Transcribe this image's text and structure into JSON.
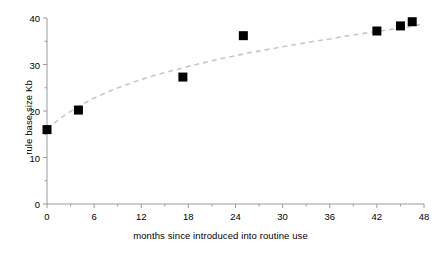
{
  "chart_data": {
    "type": "scatter",
    "title": "",
    "xlabel": "months since introduced into routine use",
    "ylabel": "rule base size Kb",
    "xlim": [
      0,
      48
    ],
    "ylim": [
      0,
      40
    ],
    "xticks": [
      0,
      6,
      12,
      18,
      24,
      30,
      36,
      42,
      48
    ],
    "yticks": [
      0,
      10,
      20,
      30,
      40
    ],
    "x_minor_tick_interval": 3,
    "y_minor_tick_interval": 5,
    "grid": false,
    "legend": null,
    "marker": {
      "shape": "square",
      "color": "#000000",
      "size_px": 9
    },
    "series": [
      {
        "name": "rule base size",
        "points": [
          {
            "x": 0.0,
            "y": 16.0
          },
          {
            "x": 4.0,
            "y": 20.2
          },
          {
            "x": 17.3,
            "y": 27.3
          },
          {
            "x": 25.0,
            "y": 36.2
          },
          {
            "x": 42.0,
            "y": 37.2
          },
          {
            "x": 45.0,
            "y": 38.3
          },
          {
            "x": 46.5,
            "y": 39.2
          }
        ]
      }
    ],
    "trendline": {
      "style": "dashed",
      "color": "#c8c8c8",
      "type": "logarithmic",
      "points": [
        {
          "x": 0.0,
          "y": 16.2
        },
        {
          "x": 2.0,
          "y": 18.8
        },
        {
          "x": 4.0,
          "y": 21.0
        },
        {
          "x": 6.0,
          "y": 22.8
        },
        {
          "x": 8.0,
          "y": 24.3
        },
        {
          "x": 10.0,
          "y": 25.6
        },
        {
          "x": 12.0,
          "y": 26.8
        },
        {
          "x": 14.0,
          "y": 27.8
        },
        {
          "x": 16.0,
          "y": 28.7
        },
        {
          "x": 18.0,
          "y": 29.6
        },
        {
          "x": 20.0,
          "y": 30.4
        },
        {
          "x": 22.0,
          "y": 31.2
        },
        {
          "x": 24.0,
          "y": 31.9
        },
        {
          "x": 26.0,
          "y": 32.6
        },
        {
          "x": 28.0,
          "y": 33.2
        },
        {
          "x": 30.0,
          "y": 33.8
        },
        {
          "x": 32.0,
          "y": 34.4
        },
        {
          "x": 34.0,
          "y": 35.0
        },
        {
          "x": 36.0,
          "y": 35.5
        },
        {
          "x": 38.0,
          "y": 36.1
        },
        {
          "x": 40.0,
          "y": 36.6
        },
        {
          "x": 42.0,
          "y": 37.1
        },
        {
          "x": 44.0,
          "y": 37.6
        },
        {
          "x": 46.0,
          "y": 38.1
        },
        {
          "x": 47.5,
          "y": 38.6
        }
      ]
    },
    "axis_color": "#9a9a9a",
    "text_color": "#000000"
  }
}
